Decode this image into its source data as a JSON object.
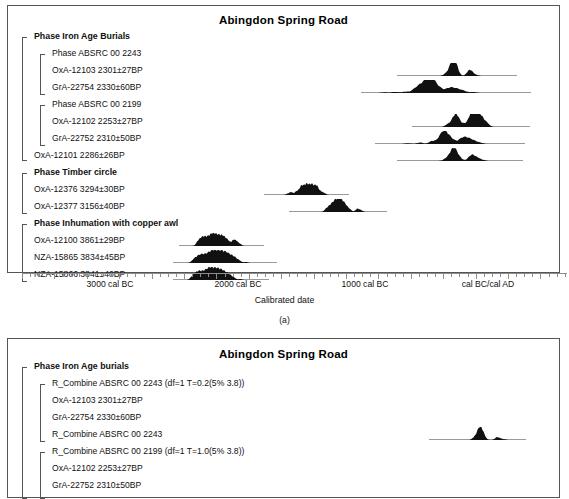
{
  "figure": {
    "caption_a": "(a)",
    "axis_caption": "Calibrated date"
  },
  "panel_a": {
    "title": "Abingdon Spring Road",
    "axis": {
      "labels": [
        "3000 cal BC",
        "2000 cal BC",
        "1000 cal BC",
        "cal BC/cal AD"
      ],
      "label_x": [
        110,
        238,
        365,
        488
      ],
      "tick_start_x": 14,
      "tick_spacing": 8.1,
      "tick_count": 68,
      "major_every": 4
    },
    "rows": [
      {
        "label": "Phase Iron Age Burials",
        "bold": true,
        "x": 26,
        "y": 34,
        "dist": null
      },
      {
        "label": "Phase ABSRC 00 2243",
        "bold": false,
        "x": 44,
        "y": 51,
        "dist": null
      },
      {
        "label": "OxA-12103  2301±27BP",
        "bold": false,
        "x": 44,
        "y": 68,
        "dist": {
          "x": 396,
          "w": 120,
          "peaks": [
            [
              0.4,
              0.1
            ],
            [
              0.46,
              0.92
            ],
            [
              0.48,
              0.55
            ],
            [
              0.5,
              0.16
            ],
            [
              0.6,
              0.34
            ],
            [
              0.62,
              0.22
            ],
            [
              0.66,
              0.08
            ]
          ]
        }
      },
      {
        "label": "GrA-22754  2330±60BP",
        "bold": false,
        "x": 44,
        "y": 85,
        "dist": {
          "x": 360,
          "w": 170,
          "peaks": [
            [
              0.14,
              0.06
            ],
            [
              0.2,
              0.09
            ],
            [
              0.26,
              0.1
            ],
            [
              0.32,
              0.3
            ],
            [
              0.36,
              0.52
            ],
            [
              0.4,
              0.85
            ],
            [
              0.43,
              0.55
            ],
            [
              0.47,
              0.22
            ],
            [
              0.52,
              0.38
            ],
            [
              0.56,
              0.3
            ],
            [
              0.6,
              0.18
            ],
            [
              0.66,
              0.08
            ]
          ]
        }
      },
      {
        "label": "Phase ABSRC 00 2199",
        "bold": false,
        "x": 44,
        "y": 102,
        "dist": null
      },
      {
        "label": "OxA-12102  2253±27BP",
        "bold": false,
        "x": 44,
        "y": 119,
        "dist": {
          "x": 411,
          "w": 118,
          "peaks": [
            [
              0.3,
              0.18
            ],
            [
              0.36,
              0.8
            ],
            [
              0.39,
              0.45
            ],
            [
              0.44,
              0.2
            ],
            [
              0.5,
              0.72
            ],
            [
              0.53,
              0.88
            ],
            [
              0.56,
              0.7
            ],
            [
              0.6,
              0.5
            ],
            [
              0.64,
              0.22
            ]
          ]
        }
      },
      {
        "label": "GrA-22752  2310±50BP",
        "bold": false,
        "x": 44,
        "y": 136,
        "dist": {
          "x": 374,
          "w": 150,
          "peaks": [
            [
              0.22,
              0.06
            ],
            [
              0.3,
              0.12
            ],
            [
              0.38,
              0.22
            ],
            [
              0.45,
              0.8
            ],
            [
              0.48,
              0.5
            ],
            [
              0.52,
              0.26
            ],
            [
              0.58,
              0.44
            ],
            [
              0.62,
              0.4
            ],
            [
              0.66,
              0.22
            ],
            [
              0.7,
              0.1
            ]
          ]
        }
      },
      {
        "label": "OxA-12101  2286±26BP",
        "bold": false,
        "x": 26,
        "y": 153,
        "dist": {
          "x": 396,
          "w": 126,
          "peaks": [
            [
              0.38,
              0.12
            ],
            [
              0.44,
              0.85
            ],
            [
              0.47,
              0.42
            ],
            [
              0.51,
              0.12
            ],
            [
              0.58,
              0.3
            ],
            [
              0.61,
              0.34
            ],
            [
              0.65,
              0.18
            ],
            [
              0.69,
              0.06
            ]
          ]
        }
      },
      {
        "label": "Phase Timber circle",
        "bold": true,
        "x": 26,
        "y": 170,
        "dist": null
      },
      {
        "label": "OxA-12376  3294±30BP",
        "bold": false,
        "x": 26,
        "y": 187,
        "dist": {
          "x": 263,
          "w": 85,
          "peaks": [
            [
              0.28,
              0.1
            ],
            [
              0.32,
              0.22
            ],
            [
              0.38,
              0.26
            ],
            [
              0.44,
              0.7
            ],
            [
              0.5,
              0.8
            ],
            [
              0.56,
              0.78
            ],
            [
              0.62,
              0.72
            ],
            [
              0.68,
              0.22
            ],
            [
              0.72,
              0.1
            ]
          ]
        }
      },
      {
        "label": "OxA-12377  3156±40BP",
        "bold": false,
        "x": 26,
        "y": 204,
        "dist": {
          "x": 288,
          "w": 98,
          "peaks": [
            [
              0.38,
              0.22
            ],
            [
              0.42,
              0.42
            ],
            [
              0.46,
              0.56
            ],
            [
              0.5,
              0.8
            ],
            [
              0.54,
              0.66
            ],
            [
              0.58,
              0.4
            ],
            [
              0.62,
              0.18
            ],
            [
              0.7,
              0.26
            ],
            [
              0.74,
              0.1
            ]
          ]
        }
      },
      {
        "label": "Phase Inhumation with copper awl",
        "bold": true,
        "x": 26,
        "y": 221,
        "dist": null
      },
      {
        "label": "OxA-12100  3861±29BP",
        "bold": false,
        "x": 26,
        "y": 238,
        "dist": {
          "x": 178,
          "w": 85,
          "peaks": [
            [
              0.22,
              0.3
            ],
            [
              0.26,
              0.5
            ],
            [
              0.3,
              0.56
            ],
            [
              0.34,
              0.44
            ],
            [
              0.38,
              0.7
            ],
            [
              0.42,
              0.66
            ],
            [
              0.46,
              0.56
            ],
            [
              0.5,
              0.62
            ],
            [
              0.54,
              0.5
            ],
            [
              0.58,
              0.34
            ],
            [
              0.64,
              0.44
            ],
            [
              0.68,
              0.3
            ],
            [
              0.72,
              0.14
            ]
          ]
        }
      },
      {
        "label": "NZA-15865  3834±45BP",
        "bold": false,
        "x": 26,
        "y": 255,
        "dist": {
          "x": 172,
          "w": 104,
          "peaks": [
            [
              0.2,
              0.26
            ],
            [
              0.24,
              0.44
            ],
            [
              0.28,
              0.52
            ],
            [
              0.32,
              0.46
            ],
            [
              0.36,
              0.64
            ],
            [
              0.4,
              0.7
            ],
            [
              0.44,
              0.62
            ],
            [
              0.48,
              0.66
            ],
            [
              0.52,
              0.56
            ],
            [
              0.56,
              0.46
            ],
            [
              0.6,
              0.34
            ],
            [
              0.64,
              0.16
            ],
            [
              0.7,
              0.08
            ]
          ]
        }
      },
      {
        "label": "NZA-15866  3841±40BP",
        "bold": false,
        "x": 26,
        "y": 272,
        "dist": {
          "x": 172,
          "w": 96,
          "peaks": [
            [
              0.2,
              0.26
            ],
            [
              0.24,
              0.46
            ],
            [
              0.28,
              0.54
            ],
            [
              0.32,
              0.44
            ],
            [
              0.36,
              0.64
            ],
            [
              0.4,
              0.68
            ],
            [
              0.44,
              0.6
            ],
            [
              0.48,
              0.64
            ],
            [
              0.52,
              0.52
            ],
            [
              0.56,
              0.44
            ],
            [
              0.6,
              0.3
            ],
            [
              0.64,
              0.14
            ],
            [
              0.7,
              0.08
            ]
          ]
        }
      }
    ],
    "brackets": [
      {
        "x": 14,
        "y": 31,
        "h": 124
      },
      {
        "x": 32,
        "y": 48,
        "h": 41
      },
      {
        "x": 32,
        "y": 99,
        "h": 41
      },
      {
        "x": 14,
        "y": 167,
        "h": 41
      },
      {
        "x": 14,
        "y": 218,
        "h": 58
      }
    ]
  },
  "panel_b": {
    "title": "Abingdon Spring Road",
    "rows": [
      {
        "label": "Phase Iron Age burials",
        "bold": true,
        "x": 26,
        "y": 31,
        "dist": null
      },
      {
        "label": "R_Combine ABSRC 00 2243 (df=1 T=0.2(5% 3.8))",
        "bold": false,
        "x": 44,
        "y": 48,
        "dist": null
      },
      {
        "label": "OxA-12103  2301±27BP",
        "bold": false,
        "x": 44,
        "y": 65,
        "dist": null
      },
      {
        "label": "GrA-22754  2330±60BP",
        "bold": false,
        "x": 44,
        "y": 82,
        "dist": null
      },
      {
        "label": "R_Combine ABSRC 00 2243",
        "bold": false,
        "x": 44,
        "y": 99,
        "dist": {
          "x": 428,
          "w": 97,
          "peaks": [
            [
              0.46,
              0.12
            ],
            [
              0.52,
              0.95
            ],
            [
              0.55,
              0.3
            ],
            [
              0.58,
              0.1
            ],
            [
              0.7,
              0.22
            ],
            [
              0.74,
              0.1
            ],
            [
              0.78,
              0.05
            ]
          ]
        }
      },
      {
        "label": "R_Combine ABSRC 00 2199 (df=1 T=1.0(5% 3.8))",
        "bold": false,
        "x": 44,
        "y": 116,
        "dist": null
      },
      {
        "label": "OxA-12102  2253±27BP",
        "bold": false,
        "x": 44,
        "y": 133,
        "dist": null
      },
      {
        "label": "GrA-22752  2310±50BP",
        "bold": false,
        "x": 44,
        "y": 150,
        "dist": null
      }
    ],
    "brackets": [
      {
        "x": 14,
        "y": 28,
        "h": 132
      },
      {
        "x": 32,
        "y": 45,
        "h": 58
      },
      {
        "x": 32,
        "y": 113,
        "h": 47
      }
    ]
  },
  "chart_data": {
    "type": "area",
    "title": "Abingdon Spring Road",
    "xlabel": "Calibrated date",
    "ylabel": "",
    "xlim": [
      -3550,
      220
    ],
    "grid": false,
    "legend": "none",
    "x_tick_labels": [
      "3000 cal BC",
      "2000 cal BC",
      "1000 cal BC",
      "cal BC/cal AD"
    ],
    "x_tick_values": [
      -3000,
      -2000,
      -1000,
      0
    ],
    "series": [
      {
        "name": "OxA-12103  2301±27BP",
        "bp": 2301,
        "error": 27,
        "group": "Phase ABSRC 00 2243"
      },
      {
        "name": "GrA-22754  2330±60BP",
        "bp": 2330,
        "error": 60,
        "group": "Phase ABSRC 00 2243"
      },
      {
        "name": "OxA-12102  2253±27BP",
        "bp": 2253,
        "error": 27,
        "group": "Phase ABSRC 00 2199"
      },
      {
        "name": "GrA-22752  2310±50BP",
        "bp": 2310,
        "error": 50,
        "group": "Phase ABSRC 00 2199"
      },
      {
        "name": "OxA-12101  2286±26BP",
        "bp": 2286,
        "error": 26,
        "group": "Phase Iron Age Burials"
      },
      {
        "name": "OxA-12376  3294±30BP",
        "bp": 3294,
        "error": 30,
        "group": "Phase Timber circle"
      },
      {
        "name": "OxA-12377  3156±40BP",
        "bp": 3156,
        "error": 40,
        "group": "Phase Timber circle"
      },
      {
        "name": "OxA-12100  3861±29BP",
        "bp": 3861,
        "error": 29,
        "group": "Phase Inhumation with copper awl"
      },
      {
        "name": "NZA-15865  3834±45BP",
        "bp": 3834,
        "error": 45,
        "group": "Phase Inhumation with copper awl"
      },
      {
        "name": "NZA-15866  3841±40BP",
        "bp": 3841,
        "error": 40,
        "group": "Phase Inhumation with copper awl"
      }
    ]
  }
}
